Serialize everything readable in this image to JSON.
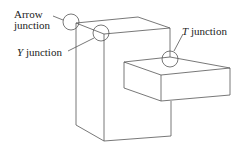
{
  "labels": {
    "arrow_line1": "Arrow",
    "arrow_line2": "junction",
    "y_letter": "Y",
    "y_rest": " junction",
    "t_letter": "T",
    "t_rest": " junction"
  },
  "colors": {
    "line": "#555555",
    "background": "#ffffff"
  }
}
